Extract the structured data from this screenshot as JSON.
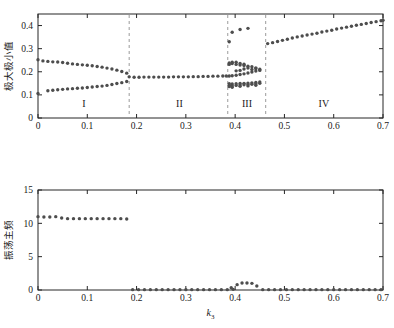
{
  "figure": {
    "background": "#ffffff",
    "marker_color": "#4d4d4d",
    "axis_color": "#262626",
    "divider_color": "#9b9b9b"
  },
  "chart_data": [
    {
      "type": "scatter",
      "id": "upper-bifurcation",
      "title": "",
      "xlabel": "",
      "ylabel": "极大极小值",
      "xlim": [
        0,
        0.7
      ],
      "ylim": [
        0,
        0.45
      ],
      "xticks": [
        0,
        0.1,
        0.2,
        0.3,
        0.4,
        0.5,
        0.6,
        0.7
      ],
      "xticklabels": [
        "0",
        "0.1",
        "0.2",
        "0.3",
        "0.4",
        "0.5",
        "0.6",
        "0.7"
      ],
      "yticks": [
        0,
        0.1,
        0.2,
        0.3,
        0.4
      ],
      "yticklabels": [
        "0",
        "0.1",
        "0.2",
        "0.3",
        "0.4"
      ],
      "grid": false,
      "legend": null,
      "annotations": [
        {
          "text": "I",
          "x": 0.093,
          "y": 0.048
        },
        {
          "text": "II",
          "x": 0.287,
          "y": 0.048
        },
        {
          "text": "III",
          "x": 0.424,
          "y": 0.048
        },
        {
          "text": "IV",
          "x": 0.58,
          "y": 0.048
        }
      ],
      "dividers": [
        0.185,
        0.385,
        0.462
      ],
      "series": [
        {
          "name": "local maxima branch",
          "points": [
            [
              0.0,
              0.252
            ],
            [
              0.01,
              0.247
            ],
            [
              0.02,
              0.245
            ],
            [
              0.03,
              0.243
            ],
            [
              0.04,
              0.242
            ],
            [
              0.05,
              0.24
            ],
            [
              0.06,
              0.237
            ],
            [
              0.07,
              0.234
            ],
            [
              0.08,
              0.232
            ],
            [
              0.09,
              0.23
            ],
            [
              0.1,
              0.228
            ],
            [
              0.11,
              0.226
            ],
            [
              0.12,
              0.223
            ],
            [
              0.13,
              0.22
            ],
            [
              0.14,
              0.216
            ],
            [
              0.15,
              0.212
            ],
            [
              0.16,
              0.207
            ],
            [
              0.17,
              0.201
            ],
            [
              0.18,
              0.194
            ],
            [
              0.185,
              0.178
            ],
            [
              0.195,
              0.176
            ],
            [
              0.205,
              0.176
            ],
            [
              0.215,
              0.177
            ],
            [
              0.225,
              0.177
            ],
            [
              0.235,
              0.177
            ],
            [
              0.245,
              0.177
            ],
            [
              0.255,
              0.177
            ],
            [
              0.265,
              0.177
            ],
            [
              0.275,
              0.178
            ],
            [
              0.285,
              0.178
            ],
            [
              0.295,
              0.178
            ],
            [
              0.305,
              0.178
            ],
            [
              0.315,
              0.179
            ],
            [
              0.325,
              0.179
            ],
            [
              0.335,
              0.18
            ],
            [
              0.345,
              0.18
            ],
            [
              0.355,
              0.181
            ],
            [
              0.365,
              0.181
            ],
            [
              0.375,
              0.182
            ],
            [
              0.382,
              0.182
            ]
          ]
        },
        {
          "name": "local minima branch",
          "points": [
            [
              0.0,
              0.106
            ],
            [
              0.02,
              0.118
            ],
            [
              0.03,
              0.12
            ],
            [
              0.04,
              0.122
            ],
            [
              0.05,
              0.124
            ],
            [
              0.06,
              0.126
            ],
            [
              0.07,
              0.127
            ],
            [
              0.08,
              0.129
            ],
            [
              0.09,
              0.13
            ],
            [
              0.1,
              0.132
            ],
            [
              0.11,
              0.134
            ],
            [
              0.12,
              0.136
            ],
            [
              0.13,
              0.138
            ],
            [
              0.14,
              0.141
            ],
            [
              0.15,
              0.145
            ],
            [
              0.16,
              0.149
            ],
            [
              0.17,
              0.153
            ],
            [
              0.18,
              0.158
            ]
          ]
        },
        {
          "name": "region III chaotic band",
          "points": [
            [
              0.388,
              0.182
            ],
            [
              0.388,
              0.232
            ],
            [
              0.388,
              0.238
            ],
            [
              0.388,
              0.33
            ],
            [
              0.388,
              0.148
            ],
            [
              0.388,
              0.142
            ],
            [
              0.388,
              0.136
            ],
            [
              0.394,
              0.183
            ],
            [
              0.394,
              0.236
            ],
            [
              0.394,
              0.241
            ],
            [
              0.394,
              0.371
            ],
            [
              0.394,
              0.147
            ],
            [
              0.394,
              0.14
            ],
            [
              0.394,
              0.133
            ],
            [
              0.402,
              0.185
            ],
            [
              0.402,
              0.204
            ],
            [
              0.402,
              0.232
            ],
            [
              0.402,
              0.241
            ],
            [
              0.402,
              0.148
            ],
            [
              0.402,
              0.141
            ],
            [
              0.41,
              0.188
            ],
            [
              0.41,
              0.206
            ],
            [
              0.41,
              0.229
            ],
            [
              0.41,
              0.236
            ],
            [
              0.41,
              0.383
            ],
            [
              0.41,
              0.149
            ],
            [
              0.41,
              0.143
            ],
            [
              0.41,
              0.137
            ],
            [
              0.418,
              0.191
            ],
            [
              0.418,
              0.212
            ],
            [
              0.418,
              0.227
            ],
            [
              0.418,
              0.233
            ],
            [
              0.418,
              0.15
            ],
            [
              0.418,
              0.144
            ],
            [
              0.426,
              0.195
            ],
            [
              0.426,
              0.216
            ],
            [
              0.426,
              0.224
            ],
            [
              0.426,
              0.388
            ],
            [
              0.426,
              0.151
            ],
            [
              0.426,
              0.145
            ],
            [
              0.426,
              0.139
            ],
            [
              0.434,
              0.199
            ],
            [
              0.434,
              0.21
            ],
            [
              0.434,
              0.222
            ],
            [
              0.434,
              0.152
            ],
            [
              0.434,
              0.146
            ],
            [
              0.442,
              0.203
            ],
            [
              0.442,
              0.213
            ],
            [
              0.442,
              0.217
            ],
            [
              0.442,
              0.154
            ],
            [
              0.442,
              0.148
            ],
            [
              0.442,
              0.142
            ],
            [
              0.45,
              0.206
            ],
            [
              0.45,
              0.211
            ],
            [
              0.45,
              0.156
            ],
            [
              0.45,
              0.15
            ]
          ]
        },
        {
          "name": "region IV rising branch",
          "points": [
            [
              0.466,
              0.322
            ],
            [
              0.476,
              0.326
            ],
            [
              0.486,
              0.331
            ],
            [
              0.496,
              0.336
            ],
            [
              0.506,
              0.341
            ],
            [
              0.516,
              0.346
            ],
            [
              0.526,
              0.351
            ],
            [
              0.536,
              0.355
            ],
            [
              0.546,
              0.359
            ],
            [
              0.556,
              0.363
            ],
            [
              0.566,
              0.367
            ],
            [
              0.576,
              0.372
            ],
            [
              0.586,
              0.376
            ],
            [
              0.596,
              0.38
            ],
            [
              0.606,
              0.385
            ],
            [
              0.616,
              0.389
            ],
            [
              0.626,
              0.393
            ],
            [
              0.636,
              0.397
            ],
            [
              0.646,
              0.401
            ],
            [
              0.656,
              0.405
            ],
            [
              0.666,
              0.409
            ],
            [
              0.676,
              0.413
            ],
            [
              0.686,
              0.417
            ],
            [
              0.696,
              0.421
            ],
            [
              0.7,
              0.423
            ]
          ]
        }
      ]
    },
    {
      "type": "scatter",
      "id": "lower-frequency",
      "title": "",
      "xlabel": "k₃",
      "ylabel": "振荡主频",
      "xlim": [
        0,
        0.7
      ],
      "ylim": [
        0,
        15
      ],
      "xticks": [
        0,
        0.1,
        0.2,
        0.3,
        0.4,
        0.5,
        0.6,
        0.7
      ],
      "xticklabels": [
        "0",
        "0.1",
        "0.2",
        "0.3",
        "0.4",
        "0.5",
        "0.6",
        "0.7"
      ],
      "yticks": [
        0,
        5,
        10,
        15
      ],
      "yticklabels": [
        "0",
        "5",
        "10",
        "15"
      ],
      "grid": false,
      "legend": null,
      "annotations": [],
      "dividers": [],
      "series": [
        {
          "name": "dominant oscillation frequency",
          "points": [
            [
              0.0,
              11.0
            ],
            [
              0.012,
              10.95
            ],
            [
              0.024,
              10.95
            ],
            [
              0.036,
              11.0
            ],
            [
              0.048,
              10.8
            ],
            [
              0.06,
              10.7
            ],
            [
              0.072,
              10.7
            ],
            [
              0.084,
              10.7
            ],
            [
              0.096,
              10.7
            ],
            [
              0.108,
              10.7
            ],
            [
              0.12,
              10.7
            ],
            [
              0.132,
              10.7
            ],
            [
              0.144,
              10.7
            ],
            [
              0.156,
              10.7
            ],
            [
              0.168,
              10.7
            ],
            [
              0.18,
              10.65
            ],
            [
              0.192,
              0.05
            ],
            [
              0.204,
              0.05
            ],
            [
              0.216,
              0.05
            ],
            [
              0.228,
              0.05
            ],
            [
              0.24,
              0.05
            ],
            [
              0.252,
              0.05
            ],
            [
              0.264,
              0.05
            ],
            [
              0.276,
              0.05
            ],
            [
              0.288,
              0.05
            ],
            [
              0.3,
              0.05
            ],
            [
              0.312,
              0.05
            ],
            [
              0.324,
              0.05
            ],
            [
              0.336,
              0.05
            ],
            [
              0.348,
              0.05
            ],
            [
              0.36,
              0.05
            ],
            [
              0.372,
              0.05
            ],
            [
              0.384,
              0.05
            ],
            [
              0.392,
              0.35
            ],
            [
              0.396,
              0.1
            ],
            [
              0.404,
              0.8
            ],
            [
              0.414,
              1.05
            ],
            [
              0.424,
              1.05
            ],
            [
              0.434,
              1.0
            ],
            [
              0.444,
              0.6
            ],
            [
              0.456,
              0.05
            ],
            [
              0.468,
              0.05
            ],
            [
              0.48,
              0.05
            ],
            [
              0.492,
              0.05
            ],
            [
              0.504,
              0.05
            ],
            [
              0.516,
              0.05
            ],
            [
              0.528,
              0.05
            ],
            [
              0.54,
              0.05
            ],
            [
              0.552,
              0.05
            ],
            [
              0.564,
              0.05
            ],
            [
              0.576,
              0.05
            ],
            [
              0.588,
              0.05
            ],
            [
              0.6,
              0.05
            ],
            [
              0.612,
              0.05
            ],
            [
              0.624,
              0.05
            ],
            [
              0.636,
              0.05
            ],
            [
              0.648,
              0.05
            ],
            [
              0.66,
              0.05
            ],
            [
              0.672,
              0.05
            ],
            [
              0.684,
              0.05
            ],
            [
              0.696,
              0.05
            ]
          ]
        }
      ]
    }
  ]
}
